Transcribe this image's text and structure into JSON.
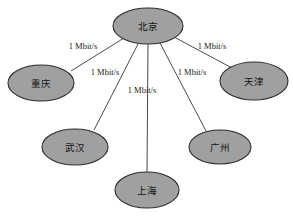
{
  "diagram": {
    "type": "network-topology",
    "title": "",
    "background_color": "#ffffff",
    "node_fill_color": "#a0a0a0",
    "node_stroke_color": "#2e2e2e",
    "edge_color": "#4a4a4a",
    "nodes": [
      {
        "id": "beijing",
        "label": "北京",
        "cx": 148,
        "cy": 26,
        "rx": 35,
        "ry": 18
      },
      {
        "id": "chongqing",
        "label": "重庆",
        "cx": 41,
        "cy": 83,
        "rx": 33,
        "ry": 18
      },
      {
        "id": "tianjin",
        "label": "天津",
        "cx": 254,
        "cy": 81,
        "rx": 34,
        "ry": 19
      },
      {
        "id": "wuhan",
        "label": "武汉",
        "cx": 75,
        "cy": 147,
        "rx": 33,
        "ry": 18
      },
      {
        "id": "guangzhou",
        "label": "广州",
        "cx": 220,
        "cy": 147,
        "rx": 31,
        "ry": 17
      },
      {
        "id": "shanghai",
        "label": "上海",
        "cx": 147,
        "cy": 190,
        "rx": 32,
        "ry": 18
      }
    ],
    "edges": [
      {
        "id": "beijing-chongqing",
        "from": "beijing",
        "to": "chongqing",
        "label": "1 Mbit/s",
        "label_x": 83,
        "label_y": 47,
        "x1": 124,
        "y1": 38,
        "x2": 71,
        "y2": 71
      },
      {
        "id": "beijing-tianjin",
        "from": "beijing",
        "to": "tianjin",
        "label": "1 Mbit/s",
        "label_x": 212,
        "label_y": 47,
        "x1": 174,
        "y1": 37,
        "x2": 232,
        "y2": 68
      },
      {
        "id": "beijing-wuhan",
        "from": "beijing",
        "to": "wuhan",
        "label": "1 Mbit/s",
        "label_x": 105,
        "label_y": 73,
        "x1": 138,
        "y1": 44,
        "x2": 94,
        "y2": 130
      },
      {
        "id": "beijing-guangzhou",
        "from": "beijing",
        "to": "guangzhou",
        "label": "1 Mbit/s",
        "label_x": 192,
        "label_y": 73,
        "x1": 160,
        "y1": 43,
        "x2": 206,
        "y2": 131
      },
      {
        "id": "beijing-shanghai",
        "from": "beijing",
        "to": "shanghai",
        "label": "1 Mbit/s",
        "label_x": 142,
        "label_y": 91,
        "x1": 148,
        "y1": 44,
        "x2": 147,
        "y2": 172
      }
    ]
  }
}
